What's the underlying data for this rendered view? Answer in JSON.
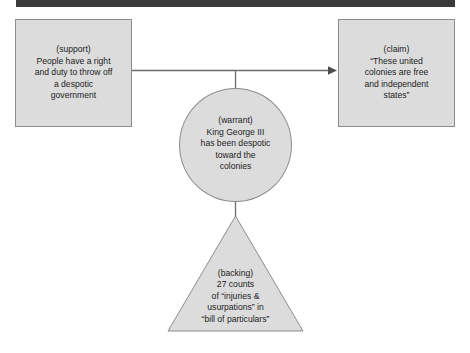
{
  "diagram": {
    "colors": {
      "node_fill": "#dcdcdc",
      "node_stroke": "#8d8d8d",
      "text": "#1d1d1d",
      "rule": "#3a3a3a",
      "connector": "#6e6e6e"
    },
    "rule_label": "top-black-rule",
    "nodes": {
      "support": {
        "role_label": "(support)",
        "text": "(support)\nPeople have a right\nand duty to throw off\na despotic\ngovernment",
        "shape": "rectangle"
      },
      "claim": {
        "role_label": "(claim)",
        "text": "(claim)\n“These united\ncolonies are free\nand independent\nstates”",
        "shape": "rectangle"
      },
      "warrant": {
        "role_label": "(warrant)",
        "text": "(warrant)\nKing George III\nhas been despotic\ntoward the\ncolonies",
        "shape": "ellipse"
      },
      "backing": {
        "role_label": "(backing)",
        "text": "(backing)\n27 counts\nof “injuries &\nusurpations” in\n“bill of particulars”",
        "shape": "triangle"
      }
    },
    "connectors": [
      {
        "name": "support-to-claim-arrow",
        "from": "support",
        "to": "claim",
        "style": "arrow",
        "direction": "right"
      },
      {
        "name": "warrant-to-arrow-connector",
        "from": "warrant",
        "to": "support-to-claim-arrow",
        "style": "line",
        "direction": "up"
      },
      {
        "name": "backing-to-warrant-connector",
        "from": "backing",
        "to": "warrant",
        "style": "line",
        "direction": "up"
      }
    ]
  }
}
